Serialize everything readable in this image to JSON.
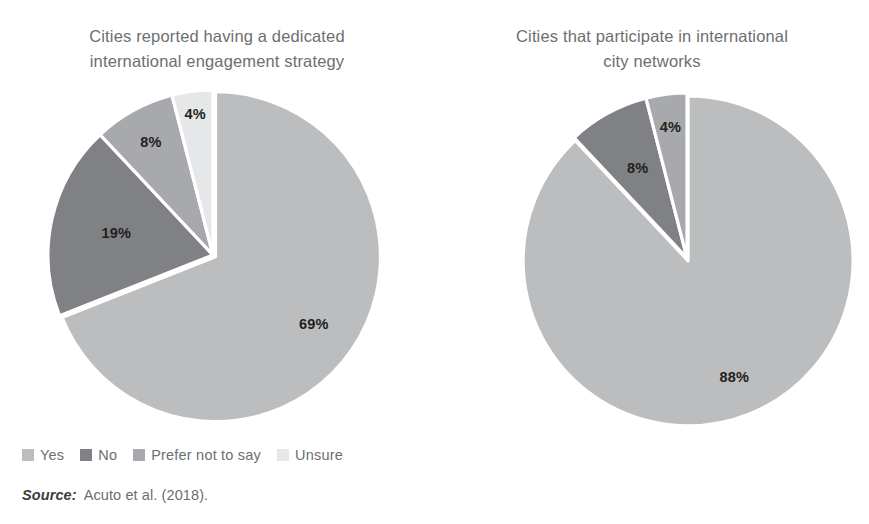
{
  "figure": {
    "background_color": "#ffffff",
    "text_color": "#6d6e71"
  },
  "charts": [
    {
      "id": "dedicated-international-engagement-strategy",
      "title_line1": "Cities reported having a dedicated",
      "title_line2": "international engagement strategy",
      "center": {
        "x": 170,
        "y": 170
      },
      "radius": 165,
      "legend": [
        {
          "label": "Yes",
          "color": "#bcbdbf"
        },
        {
          "label": "No",
          "color": "#808184"
        },
        {
          "label": "Prefer not to say",
          "color": "#a7a9ac"
        },
        {
          "label": "Unsure",
          "color": "#e6e7e8"
        }
      ]
    },
    {
      "id": "participate-in-international-city-networks",
      "title_line1": "Cities that participate in international",
      "title_line2": "city networks",
      "center": {
        "x": 170,
        "y": 170
      },
      "radius": 165,
      "legend": [
        {
          "label": "Yes",
          "color": "#bcbdbf"
        },
        {
          "label": "Prefer not to say",
          "color": "#808184"
        },
        {
          "label": "Unsure",
          "color": "#a7a9ac"
        }
      ]
    }
  ],
  "chart_data": [
    {
      "type": "pie",
      "title": "Cities reported having a dedicated international engagement strategy",
      "categories": [
        "Yes",
        "No",
        "Prefer not to say",
        "Unsure"
      ],
      "values": [
        69,
        19,
        8,
        4
      ],
      "unit": "%",
      "labels": [
        "69%",
        "19%",
        "8%",
        "4%"
      ],
      "colors": [
        "#bcbdbf",
        "#808184",
        "#a7a9ac",
        "#e6e7e8"
      ],
      "start_angle_deg": 0,
      "direction": "clockwise",
      "legend_position": "bottom-left",
      "exploded_slice": "Yes"
    },
    {
      "type": "pie",
      "title": "Cities that participate in international city networks",
      "categories": [
        "Yes",
        "Prefer not to say",
        "Unsure"
      ],
      "values": [
        88,
        8,
        4
      ],
      "unit": "%",
      "labels": [
        "88%",
        "8%",
        "4%"
      ],
      "colors": [
        "#bcbdbf",
        "#808184",
        "#a7a9ac"
      ],
      "start_angle_deg": 0,
      "direction": "clockwise",
      "legend_position": "bottom-left",
      "exploded_slice": "Yes"
    }
  ],
  "source": {
    "label": "Source:",
    "text": "Acuto et al. (2018)."
  }
}
